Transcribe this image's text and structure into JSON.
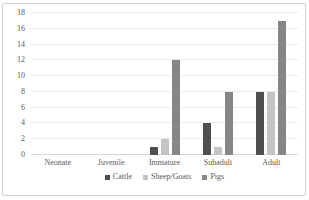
{
  "chart_data": {
    "type": "bar",
    "title": "",
    "xlabel": "",
    "ylabel": "",
    "categories": [
      "Neonate",
      "Juvenile",
      "Immature",
      "Subadult",
      "Adult"
    ],
    "series": [
      {
        "name": "Cattle",
        "color": "#4f4f4f",
        "values": [
          0,
          0,
          1,
          4,
          8
        ]
      },
      {
        "name": "Sheep/Goats",
        "color": "#c4c4c4",
        "values": [
          0,
          0,
          2,
          1,
          8
        ]
      },
      {
        "name": "Pigs",
        "color": "#868686",
        "values": [
          0,
          0,
          12,
          8,
          17
        ]
      }
    ],
    "ylim": [
      0,
      18
    ],
    "yticks": [
      0,
      2,
      4,
      6,
      8,
      10,
      12,
      14,
      16,
      18
    ],
    "grid": true,
    "legend_position": "bottom"
  },
  "style": {
    "text_color": "#595959",
    "gridline_color": "#ebebeb",
    "axis_line_color": "#d6d6d6",
    "card_border_color": "#d0d0d0",
    "background": "#ffffff"
  }
}
